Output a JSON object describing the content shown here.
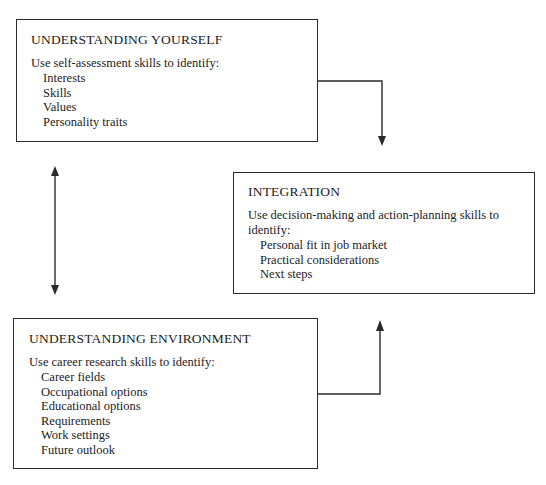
{
  "diagram": {
    "type": "flow",
    "boxes": [
      {
        "id": "yourself",
        "title": "UNDERSTANDING YOURSELF",
        "intro": "Use self-assessment skills to identify:",
        "items": [
          "Interests",
          "Skills",
          "Values",
          "Personality traits"
        ]
      },
      {
        "id": "integration",
        "title": "INTEGRATION",
        "intro": "Use decision-making and action-planning skills to identify:",
        "items": [
          "Personal fit in job market",
          "Practical considerations",
          "Next steps"
        ]
      },
      {
        "id": "environment",
        "title": "UNDERSTANDING ENVIRONMENT",
        "intro": "Use career research skills to identify:",
        "items": [
          "Career fields",
          "Occupational options",
          "Educational options",
          "Requirements",
          "Work settings",
          "Future outlook"
        ]
      }
    ],
    "connectors": [
      {
        "from": "yourself",
        "to": "integration",
        "kind": "elbow-arrow-down"
      },
      {
        "from": "environment",
        "to": "integration",
        "kind": "elbow-arrow-up"
      },
      {
        "from": "yourself",
        "to": "environment",
        "kind": "double-arrow-vertical"
      }
    ],
    "colors": {
      "line": "#2a2a2a",
      "text": "#222222",
      "background": "#ffffff"
    }
  }
}
